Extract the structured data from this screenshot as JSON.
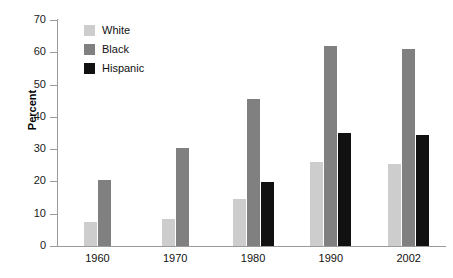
{
  "chart_data": {
    "type": "bar",
    "title": "",
    "xlabel": "",
    "ylabel": "Percent",
    "ylim": [
      0,
      70
    ],
    "yticks": [
      0,
      10,
      20,
      30,
      40,
      50,
      60,
      70
    ],
    "grid": false,
    "legend_position": "top-left",
    "categories": [
      "1960",
      "1970",
      "1980",
      "1990",
      "2002"
    ],
    "series": [
      {
        "name": "White",
        "color": "#cdcdcd",
        "values": [
          7.5,
          8.3,
          14.5,
          26.0,
          25.5
        ]
      },
      {
        "name": "Black",
        "color": "#808080",
        "values": [
          20.5,
          30.5,
          45.5,
          62.0,
          61.0
        ]
      },
      {
        "name": "Hispanic",
        "color": "#111111",
        "values": [
          null,
          null,
          19.8,
          35.0,
          34.5
        ]
      }
    ]
  },
  "axis": {
    "y_label": "Percent",
    "y_tick_labels": [
      "0",
      "10",
      "20",
      "30",
      "40",
      "50",
      "60",
      "70"
    ],
    "x_tick_labels": [
      "1960",
      "1970",
      "1980",
      "1990",
      "2002"
    ]
  },
  "legend": {
    "items": [
      {
        "label": "White",
        "color": "#cdcdcd"
      },
      {
        "label": "Black",
        "color": "#808080"
      },
      {
        "label": "Hispanic",
        "color": "#111111"
      }
    ]
  },
  "colors": {
    "white_series": "#cdcdcd",
    "black_series": "#808080",
    "hispanic_series": "#111111",
    "axis": "#9a9a9a",
    "text": "#111111",
    "background": "#ffffff"
  }
}
